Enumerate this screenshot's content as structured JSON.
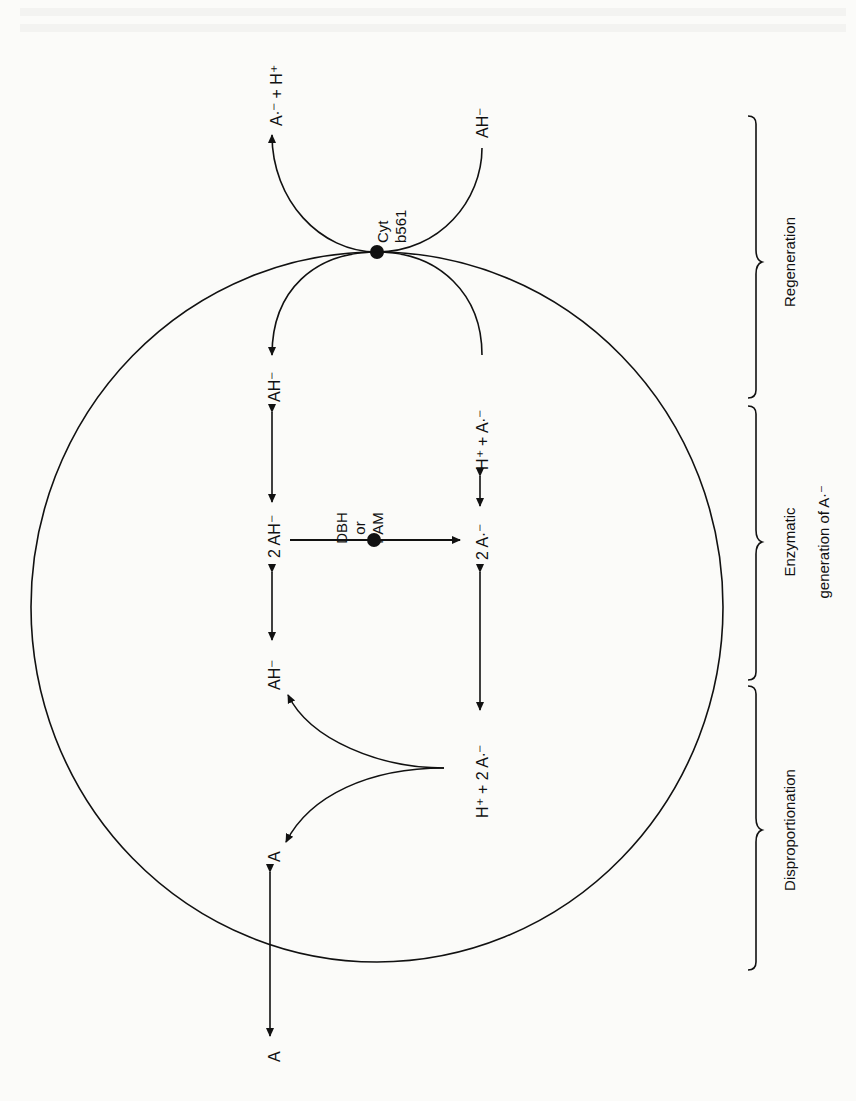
{
  "figure": {
    "orientation": "rotated 90 degrees counter-clockwise",
    "compartment": "circle",
    "center_node": {
      "label_line1": "Cyt",
      "label_line2": "b561"
    },
    "enzyme_node": {
      "label_line1": "DBH",
      "label_line2": "or",
      "label_line3": "PAM"
    },
    "species": {
      "outside_left_product": "A∙⁻ + H⁺",
      "outside_right_reactant": "AH⁻",
      "inside_ah_top": "AH⁻",
      "inside_2ah": "2 AH⁻",
      "inside_ah_mid": "AH⁻",
      "inside_a": "A",
      "outside_a": "A",
      "inside_h_a_top": "H⁺ + A∙⁻",
      "inside_2a_mid": "2 A∙⁻",
      "inside_h_2a": "H⁺ + 2 A∙⁻"
    },
    "brackets": [
      {
        "label": "Regeneration"
      },
      {
        "label_line1": "Enzymatic",
        "label_line2": "generation of A∙⁻"
      },
      {
        "label": "Disproportionation"
      }
    ]
  }
}
